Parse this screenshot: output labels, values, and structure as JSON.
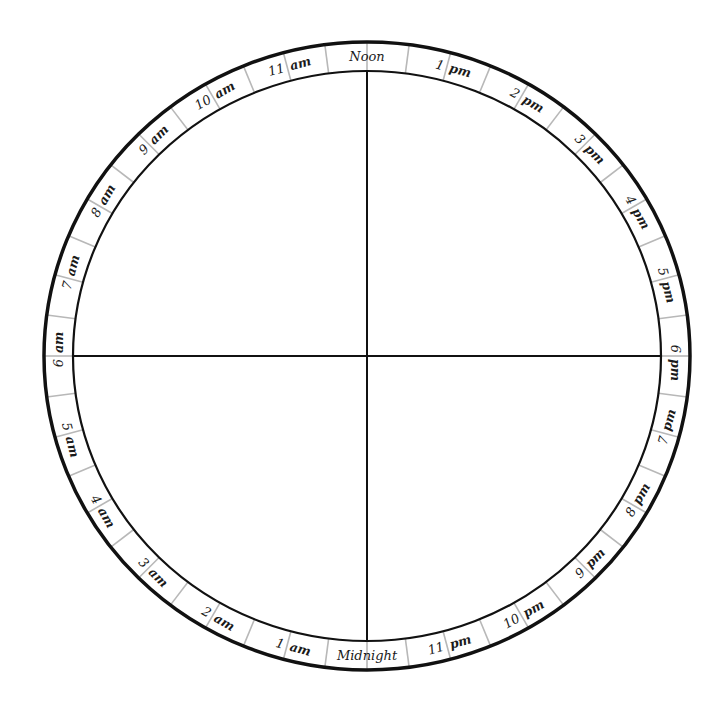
{
  "diagram": {
    "type": "24-hour-clock-face",
    "center": {
      "x": 367,
      "y": 356
    },
    "outer_radius": {
      "x": 323,
      "y": 314
    },
    "inner_radius": {
      "x": 294,
      "y": 285
    },
    "colors": {
      "ring_stroke": "#111111",
      "divider": "#b8b8b8",
      "axis": "#111111",
      "text": "#1a1a1a",
      "background": "#ffffff"
    },
    "top_label": "Noon",
    "bottom_label": "Midnight",
    "hours": [
      {
        "num": "",
        "suffix": "Noon"
      },
      {
        "num": "1",
        "suffix": "pm"
      },
      {
        "num": "2",
        "suffix": "pm"
      },
      {
        "num": "3",
        "suffix": "pm"
      },
      {
        "num": "4",
        "suffix": "pm"
      },
      {
        "num": "5",
        "suffix": "pm"
      },
      {
        "num": "6",
        "suffix": "pm"
      },
      {
        "num": "7",
        "suffix": "pm"
      },
      {
        "num": "8",
        "suffix": "pm"
      },
      {
        "num": "9",
        "suffix": "pm"
      },
      {
        "num": "10",
        "suffix": "pm"
      },
      {
        "num": "11",
        "suffix": "pm"
      },
      {
        "num": "",
        "suffix": "Midnight"
      },
      {
        "num": "1",
        "suffix": "am"
      },
      {
        "num": "2",
        "suffix": "am"
      },
      {
        "num": "3",
        "suffix": "am"
      },
      {
        "num": "4",
        "suffix": "am"
      },
      {
        "num": "5",
        "suffix": "am"
      },
      {
        "num": "6",
        "suffix": "am"
      },
      {
        "num": "7",
        "suffix": "am"
      },
      {
        "num": "8",
        "suffix": "am"
      },
      {
        "num": "9",
        "suffix": "am"
      },
      {
        "num": "10",
        "suffix": "am"
      },
      {
        "num": "11",
        "suffix": "am"
      }
    ]
  }
}
